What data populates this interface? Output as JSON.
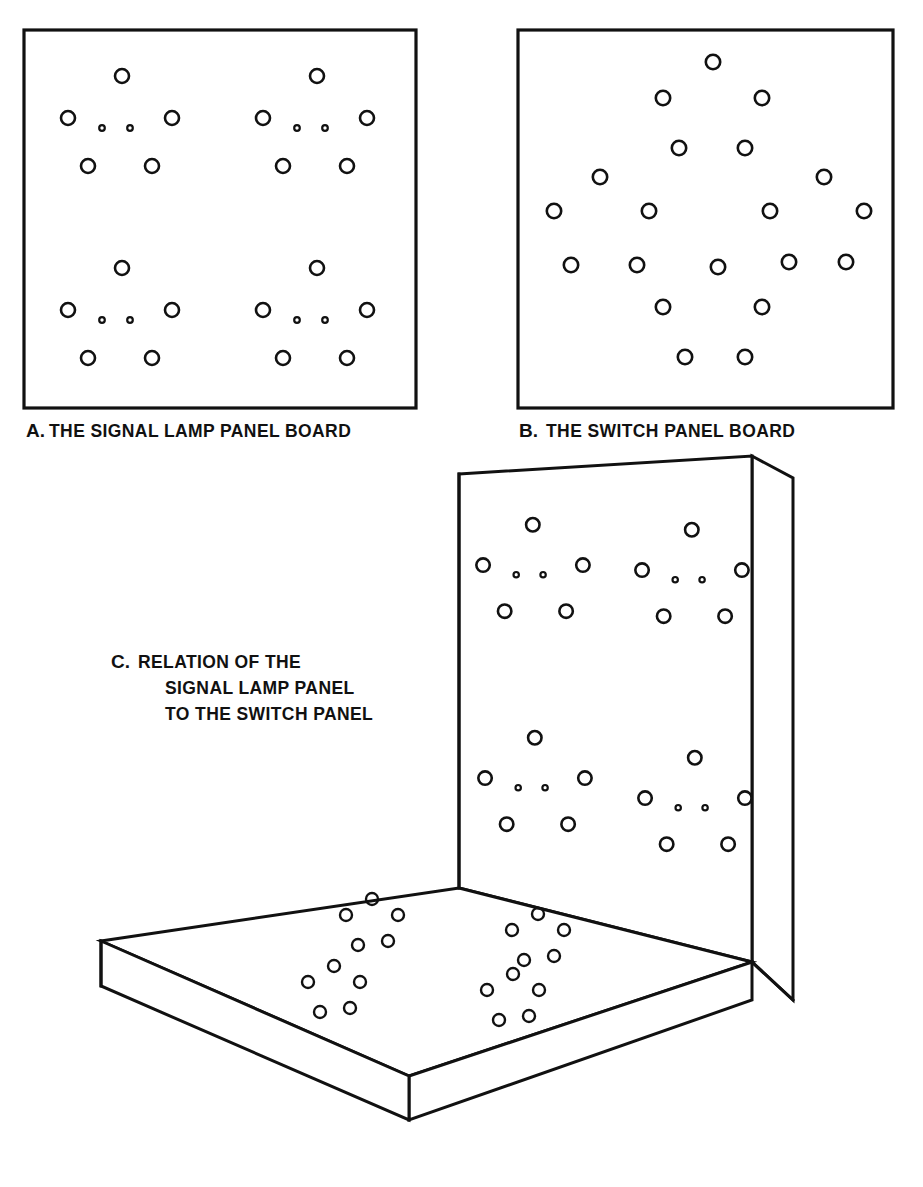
{
  "page": {
    "folio": "",
    "background_color": "#ffffff",
    "ink_color": "#111111",
    "width": 923,
    "height": 1187
  },
  "panels": [
    {
      "id": "panel-a",
      "letter": "A.",
      "caption": "THE SIGNAL LAMP PANEL BOARD",
      "caption_full": "A.THE SIGNAL LAMP PANEL BOARD",
      "frame": {
        "x": 24,
        "y": 30,
        "width": 392,
        "height": 378
      },
      "description": "Flat front view of the signal lamp panel board with four identical lamp clusters",
      "cluster_count": 4,
      "cluster_layout": "2 x 2 grid",
      "cluster_composition": {
        "large_lamps": 5,
        "large_lamp_arrangement": "pentagon: top-centre, mid-left, mid-right, bottom-left, bottom-right",
        "small_lamps": 2,
        "small_lamp_arrangement": "pair at cluster centre"
      },
      "clusters": [
        {
          "name": "cluster-top-left",
          "cx": 122,
          "cy": 120
        },
        {
          "name": "cluster-top-right",
          "cx": 317,
          "cy": 120
        },
        {
          "name": "cluster-bottom-left",
          "cx": 122,
          "cy": 312
        },
        {
          "name": "cluster-bottom-right",
          "cx": 317,
          "cy": 312
        }
      ],
      "total_large_lamps": 20,
      "total_small_lamps": 8
    },
    {
      "id": "panel-b",
      "letter": "B.",
      "caption": "THE SWITCH PANEL BOARD",
      "caption_full": "B. THE SWITCH PANEL BOARD",
      "frame": {
        "x": 518,
        "y": 30,
        "width": 375,
        "height": 378
      },
      "description": "Flat plan view of the switch panel board, twenty switch holes in a symmetric diamond array",
      "switch_count": 20,
      "switches": [
        {
          "cx": 713,
          "cy": 62
        },
        {
          "cx": 663,
          "cy": 98
        },
        {
          "cx": 762,
          "cy": 98
        },
        {
          "cx": 679,
          "cy": 148
        },
        {
          "cx": 745,
          "cy": 148
        },
        {
          "cx": 600,
          "cy": 177
        },
        {
          "cx": 824,
          "cy": 177
        },
        {
          "cx": 554,
          "cy": 211
        },
        {
          "cx": 649,
          "cy": 211
        },
        {
          "cx": 770,
          "cy": 211
        },
        {
          "cx": 864,
          "cy": 211
        },
        {
          "cx": 571,
          "cy": 265
        },
        {
          "cx": 637,
          "cy": 265
        },
        {
          "cx": 718,
          "cy": 267
        },
        {
          "cx": 789,
          "cy": 262
        },
        {
          "cx": 846,
          "cy": 262
        },
        {
          "cx": 663,
          "cy": 307
        },
        {
          "cx": 762,
          "cy": 307
        },
        {
          "cx": 685,
          "cy": 357
        },
        {
          "cx": 745,
          "cy": 357
        }
      ]
    },
    {
      "id": "panel-c",
      "letter": "C.",
      "caption_lines": [
        "RELATION OF THE",
        "SIGNAL LAMP PANEL",
        "TO THE SWITCH PANEL"
      ],
      "caption_full": "C. RELATION OF THE SIGNAL LAMP PANEL TO THE SWITCH PANEL",
      "description": "Isometric view: the vertical signal lamp panel standing behind the horizontal switch panel slab",
      "vertical_panel": {
        "name": "signal-lamp-panel-3d",
        "cluster_count": 4,
        "clusters": [
          {
            "name": "cluster-upper-left",
            "cx": 535,
            "cy": 567
          },
          {
            "name": "cluster-upper-right",
            "cx": 694,
            "cy": 572
          },
          {
            "name": "cluster-lower-left",
            "cx": 537,
            "cy": 780
          },
          {
            "name": "cluster-lower-right",
            "cx": 697,
            "cy": 800
          }
        ]
      },
      "horizontal_panel": {
        "name": "switch-panel-3d",
        "cluster_count": 4,
        "clusters": [
          {
            "name": "base-cluster-back-left",
            "cx": 372,
            "cy": 925
          },
          {
            "name": "base-cluster-back-right",
            "cx": 538,
            "cy": 940
          },
          {
            "name": "base-cluster-front-left",
            "cx": 334,
            "cy": 992
          },
          {
            "name": "base-cluster-front-right",
            "cx": 513,
            "cy": 1000
          }
        ],
        "cluster_composition": {
          "holes": 5,
          "arrangement": "pentagon / rosette of five switch holes"
        }
      }
    }
  ],
  "captions": {
    "a_letter": "A.",
    "a_text": "THE SIGNAL LAMP PANEL BOARD",
    "b_letter": "B.",
    "b_text": "THE SWITCH PANEL BOARD",
    "c_letter": "C.",
    "c_line_1": "RELATION OF THE",
    "c_line_2": "SIGNAL LAMP PANEL",
    "c_line_3": "TO THE SWITCH PANEL"
  },
  "geometry": {
    "lamp_cluster": {
      "large_radius": 7.0,
      "small_radius": 2.8,
      "offsets_large": [
        {
          "dx": 0,
          "dy": -44
        },
        {
          "dx": -54,
          "dy": -2
        },
        {
          "dx": 50,
          "dy": -2
        },
        {
          "dx": -34,
          "dy": 46
        },
        {
          "dx": 30,
          "dy": 46
        }
      ],
      "offsets_small": [
        {
          "dx": -20,
          "dy": 8
        },
        {
          "dx": 8,
          "dy": 8
        }
      ]
    },
    "switch_hole_radius": 7.2,
    "base_rosette": {
      "radius": 6.0,
      "offsets": [
        {
          "dx": 0,
          "dy": -26
        },
        {
          "dx": -26,
          "dy": -10
        },
        {
          "dx": 26,
          "dy": -10
        },
        {
          "dx": -14,
          "dy": 20
        },
        {
          "dx": 16,
          "dy": 16
        }
      ]
    }
  }
}
